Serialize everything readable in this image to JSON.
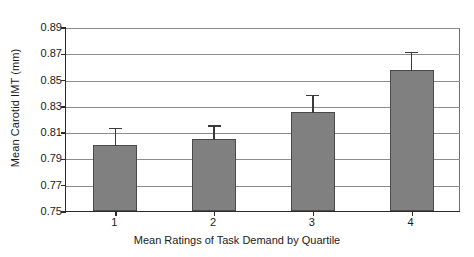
{
  "chart_data": {
    "type": "bar",
    "title": "",
    "subtitle": "",
    "xlabel": "Mean Ratings of Task Demand by Quartile",
    "ylabel": "Mean Carotid IMT (mm)",
    "categories": [
      "1",
      "2",
      "3",
      "4"
    ],
    "values": [
      0.8,
      0.805,
      0.825,
      0.857
    ],
    "errors_upper": [
      0.814,
      0.816,
      0.839,
      0.872
    ],
    "error_bar_style": "upper-only",
    "ylim": [
      0.75,
      0.89
    ],
    "ytick_labels": [
      "0.89",
      "0.87",
      "0.85",
      "0.83",
      "0.81",
      "0.79",
      "0.77",
      "0.75"
    ],
    "ytick_values": [
      0.89,
      0.87,
      0.85,
      0.83,
      0.81,
      0.79,
      0.77,
      0.75
    ],
    "ytick_step": 0.02,
    "grid": "horizontal",
    "legend": "none",
    "bar_color": "#808080",
    "bar_edge_color": "#4a4a4a",
    "grid_color": "#8c8c8c",
    "axis_color": "#2b2b2b",
    "background": "#ffffff"
  }
}
